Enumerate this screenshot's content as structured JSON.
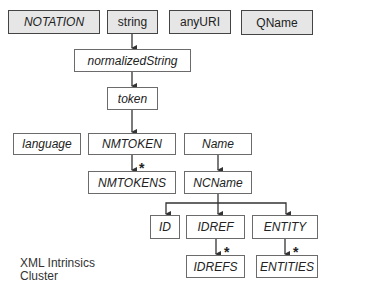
{
  "diagram": {
    "caption_lines": [
      "XML Intrinsics",
      "Cluster"
    ],
    "nodes": {
      "notation": {
        "label": "NOTATION",
        "kind": "primitive"
      },
      "string": {
        "label": "string",
        "kind": "primitive"
      },
      "anyuri": {
        "label": "anyURI",
        "kind": "primitive"
      },
      "qname": {
        "label": "QName",
        "kind": "primitive"
      },
      "normalizedstring": {
        "label": "normalizedString",
        "kind": "derived"
      },
      "token": {
        "label": "token",
        "kind": "derived"
      },
      "language": {
        "label": "language",
        "kind": "derived"
      },
      "nmtoken": {
        "label": "NMTOKEN",
        "kind": "derived"
      },
      "name": {
        "label": "Name",
        "kind": "derived"
      },
      "nmtokens": {
        "label": "NMTOKENS",
        "kind": "derived"
      },
      "ncname": {
        "label": "NCName",
        "kind": "derived"
      },
      "id": {
        "label": "ID",
        "kind": "derived"
      },
      "idref": {
        "label": "IDREF",
        "kind": "derived"
      },
      "entity": {
        "label": "ENTITY",
        "kind": "derived"
      },
      "idrefs": {
        "label": "IDREFS",
        "kind": "derived"
      },
      "entities": {
        "label": "ENTITIES",
        "kind": "derived"
      }
    },
    "edges": [
      {
        "from": "string",
        "to": "normalizedstring",
        "list": false
      },
      {
        "from": "normalizedstring",
        "to": "token",
        "list": false
      },
      {
        "from": "token",
        "to": "nmtoken",
        "list": false
      },
      {
        "from": "nmtoken",
        "to": "nmtokens",
        "list": true
      },
      {
        "from": "name",
        "to": "ncname",
        "list": false
      },
      {
        "from": "ncname",
        "to": "id",
        "list": false
      },
      {
        "from": "ncname",
        "to": "idref",
        "list": false
      },
      {
        "from": "ncname",
        "to": "entity",
        "list": false
      },
      {
        "from": "idref",
        "to": "idrefs",
        "list": true
      },
      {
        "from": "entity",
        "to": "entities",
        "list": true
      }
    ],
    "list_marker": "*"
  }
}
